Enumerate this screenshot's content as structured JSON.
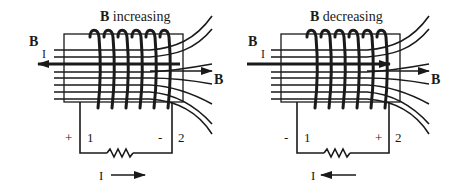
{
  "diagrams": [
    {
      "title_bold": "B",
      "title_rest": " increasing",
      "b_left_label": "B",
      "i_label": "I",
      "b_right_label": "B",
      "terminal_1": "1",
      "terminal_2": "2",
      "polarity_left": "+",
      "polarity_right": "-",
      "current_label": "I",
      "current_direction": "right",
      "inner_arrow_direction": "left"
    },
    {
      "title_bold": "B",
      "title_rest": " decreasing",
      "b_left_label": "B",
      "i_label": "I",
      "b_right_label": "B",
      "terminal_1": "1",
      "terminal_2": "2",
      "polarity_left": "-",
      "polarity_right": "+",
      "current_label": "I",
      "current_direction": "left",
      "inner_arrow_direction": "right"
    }
  ],
  "colors": {
    "ink": "#1a1a1a",
    "background": "#ffffff"
  }
}
